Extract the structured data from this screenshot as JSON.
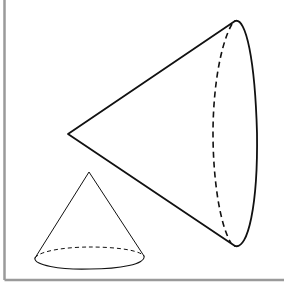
{
  "figure": {
    "colors": {
      "stroke": "#111111",
      "frame": "#9a9a9a",
      "background": "#ffffff"
    },
    "shapes": [
      {
        "name": "large-cone",
        "orientation": "horizontal",
        "apex": [
          68,
          134
        ],
        "base_top": [
          235,
          21
        ],
        "base_bottom": [
          235,
          246
        ],
        "hidden_edge": "dashed"
      },
      {
        "name": "small-cone",
        "orientation": "upright",
        "apex": [
          89,
          172
        ],
        "base_center": [
          89,
          256
        ],
        "base_rx": 55,
        "base_ry": 10,
        "hidden_edge": "dashed"
      }
    ]
  }
}
